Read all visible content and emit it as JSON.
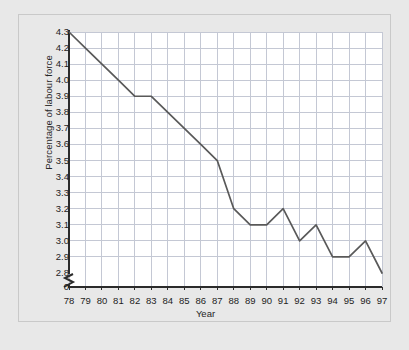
{
  "chart_data": {
    "type": "line",
    "title": "",
    "xlabel": "Year",
    "ylabel": "Percentage of labour force",
    "x": [
      "78",
      "79",
      "80",
      "81",
      "82",
      "83",
      "84",
      "85",
      "86",
      "87",
      "88",
      "89",
      "90",
      "91",
      "92",
      "93",
      "94",
      "95",
      "96",
      "97"
    ],
    "categories": [
      "78",
      "79",
      "80",
      "81",
      "82",
      "83",
      "84",
      "85",
      "86",
      "87",
      "88",
      "89",
      "90",
      "91",
      "92",
      "93",
      "94",
      "95",
      "96",
      "97"
    ],
    "values": [
      4.3,
      4.2,
      4.1,
      4.0,
      3.9,
      3.9,
      3.8,
      3.7,
      3.6,
      3.5,
      3.2,
      3.1,
      3.1,
      3.2,
      3.0,
      3.1,
      2.9,
      2.9,
      3.0,
      2.8
    ],
    "series": [
      {
        "name": "Percentage of labour force",
        "values": [
          4.3,
          4.2,
          4.1,
          4.0,
          3.9,
          3.9,
          3.8,
          3.7,
          3.6,
          3.5,
          3.2,
          3.1,
          3.1,
          3.2,
          3.0,
          3.1,
          2.9,
          2.9,
          3.0,
          2.8
        ]
      }
    ],
    "yticks": [
      "4.3",
      "4.2",
      "4.1",
      "4.0",
      "3.9",
      "3.8",
      "3.7",
      "3.6",
      "3.5",
      "3.4",
      "3.3",
      "3.2",
      "3.1",
      "3.0",
      "2.9",
      "2.8",
      "0"
    ],
    "ytick_values": [
      4.3,
      4.2,
      4.1,
      4.0,
      3.9,
      3.8,
      3.7,
      3.6,
      3.5,
      3.4,
      3.3,
      3.2,
      3.1,
      3.0,
      2.9,
      2.8
    ],
    "origin_label": "0",
    "ylim": [
      2.8,
      4.3
    ],
    "xlim": [
      "78",
      "97"
    ],
    "grid": true,
    "legend": "none",
    "axis_break": true,
    "line_color": "#595959",
    "grid_color": "#c4c8d4",
    "plot_background": "#ffffff",
    "figure_background": "#e8e8e8",
    "text_color": "#1d1d1d"
  }
}
